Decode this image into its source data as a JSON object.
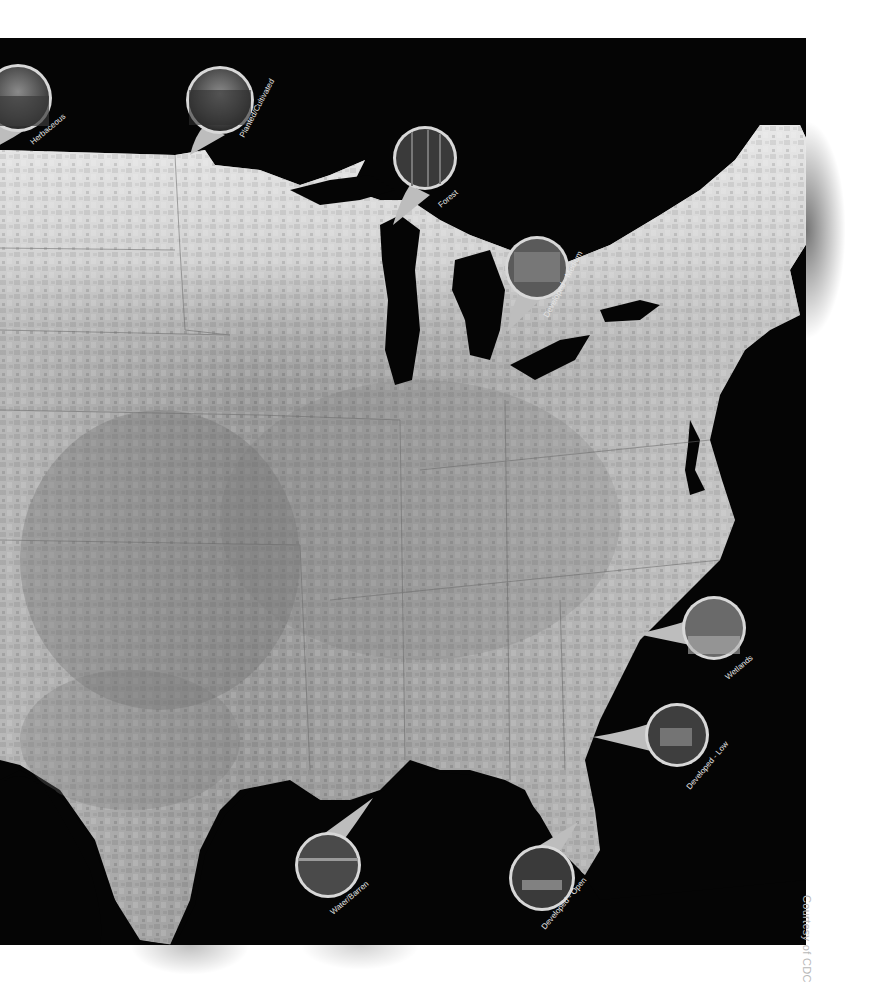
{
  "figure": {
    "type": "choropleth-map",
    "region": "Eastern United States",
    "color_scheme": "grayscale",
    "background_color": "#050505",
    "credit": "Courtesy of CDC"
  },
  "callouts": [
    {
      "id": "herbaceous",
      "label": "Herbaceous",
      "photo": "grassland-photo"
    },
    {
      "id": "planted",
      "label": "Planted/Cultivated",
      "photo": "cornfield-photo"
    },
    {
      "id": "forest",
      "label": "Forest",
      "photo": "trees-photo"
    },
    {
      "id": "dev-medium",
      "label": "Developed - Medium",
      "photo": "storefront-buildings-photo"
    },
    {
      "id": "wetlands",
      "label": "Wetlands",
      "photo": "marsh-trees-photo"
    },
    {
      "id": "dev-low",
      "label": "Developed - Low",
      "photo": "house-photo"
    },
    {
      "id": "water",
      "label": "Water/Barren",
      "photo": "water-shore-photo"
    },
    {
      "id": "dev-open",
      "label": "Developed - Open",
      "photo": "house-with-fence-photo"
    }
  ]
}
